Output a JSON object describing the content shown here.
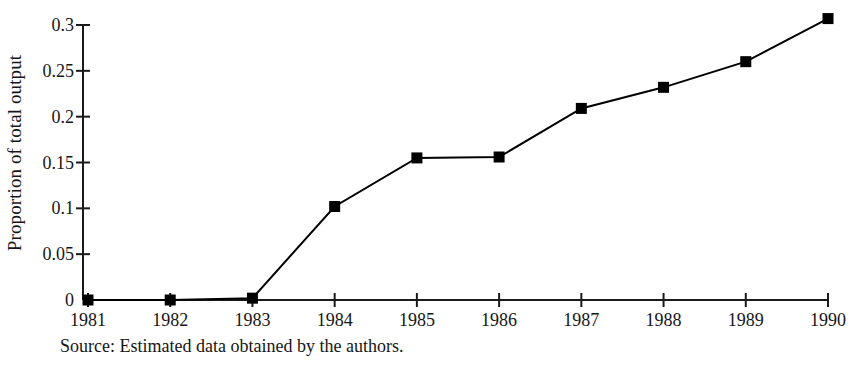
{
  "chart_data": {
    "type": "line",
    "title": "",
    "xlabel": "",
    "ylabel": "Proportion of total output",
    "categories": [
      "1981",
      "1982",
      "1983",
      "1984",
      "1985",
      "1986",
      "1987",
      "1988",
      "1989",
      "1990"
    ],
    "values": [
      0,
      0,
      0.002,
      0.102,
      0.155,
      0.156,
      0.209,
      0.232,
      0.26,
      0.307
    ],
    "series": [
      {
        "name": "Proportion of total output",
        "values": [
          0,
          0,
          0.002,
          0.102,
          0.155,
          0.156,
          0.209,
          0.232,
          0.26,
          0.307
        ]
      }
    ],
    "ylim": [
      0,
      0.3
    ],
    "yticks": [
      0,
      0.05,
      0.1,
      0.15,
      0.2,
      0.25,
      0.3
    ],
    "ytick_labels": [
      "0",
      "0.05",
      "0.1",
      "0.15",
      "0.2",
      "0.25",
      "0.3"
    ],
    "grid": false,
    "legend": "none",
    "marker": "filled-square",
    "line_color": "#000000",
    "marker_color": "#000000",
    "background_color": "#ffffff"
  },
  "caption": {
    "text": "Source: Estimated data obtained by the authors."
  }
}
